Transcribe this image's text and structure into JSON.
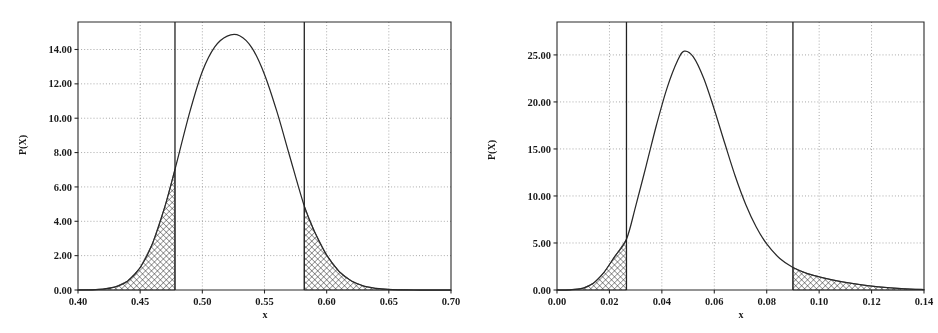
{
  "figure": {
    "panel_count": 2
  },
  "chart_data": [
    {
      "id": "left-plot",
      "type": "line",
      "title": "",
      "subtitle": "",
      "xlabel": "x",
      "ylabel": "P(X)",
      "xlim": [
        0.4,
        0.7
      ],
      "ylim": [
        0.0,
        15.6
      ],
      "grid": true,
      "legend": "none",
      "xticks": [
        0.4,
        0.45,
        0.5,
        0.55,
        0.6,
        0.65,
        0.7
      ],
      "xticklabels": [
        "0.40",
        "0.45",
        "0.50",
        "0.55",
        "0.60",
        "0.65",
        "0.70"
      ],
      "yticks": [
        0.0,
        2.0,
        4.0,
        6.0,
        8.0,
        10.0,
        12.0,
        14.0
      ],
      "yticklabels": [
        "0.00",
        "2.00",
        "4.00",
        "6.00",
        "8.00",
        "10.00",
        "12.00",
        "14.00"
      ],
      "distribution": {
        "kind": "normal-like-density",
        "peak_x": 0.53,
        "peak_y": 14.8,
        "sigma": 0.0272
      },
      "annotations": {
        "vertical_lines": [
          0.478,
          0.582
        ],
        "shaded_tails": [
          {
            "name": "lower-tail",
            "from": 0.4,
            "to": 0.478,
            "hatch": "cross-hatch"
          },
          {
            "name": "upper-tail",
            "from": 0.582,
            "to": 0.7,
            "hatch": "cross-hatch"
          }
        ]
      },
      "series": [
        {
          "name": "P(X)",
          "x": [
            0.4,
            0.41,
            0.42,
            0.43,
            0.44,
            0.45,
            0.46,
            0.47,
            0.478,
            0.49,
            0.5,
            0.51,
            0.52,
            0.53,
            0.54,
            0.55,
            0.56,
            0.57,
            0.582,
            0.59,
            0.6,
            0.61,
            0.62,
            0.63,
            0.64,
            0.65,
            0.66,
            0.67,
            0.68,
            0.69,
            0.7
          ],
          "y": [
            0.0,
            0.01,
            0.05,
            0.18,
            0.53,
            1.3,
            2.72,
            4.88,
            7.02,
            10.38,
            12.72,
            14.15,
            14.78,
            14.8,
            14.08,
            12.55,
            10.38,
            7.86,
            4.88,
            3.44,
            2.03,
            1.08,
            0.52,
            0.22,
            0.09,
            0.03,
            0.01,
            0.0,
            0.0,
            0.0,
            0.0
          ]
        }
      ]
    },
    {
      "id": "right-plot",
      "type": "line",
      "title": "",
      "subtitle": "",
      "xlabel": "x",
      "ylabel": "P(X)",
      "xlim": [
        0.0,
        0.14
      ],
      "ylim": [
        0.0,
        28.5
      ],
      "grid": true,
      "legend": "none",
      "xticks": [
        0.0,
        0.02,
        0.04,
        0.06,
        0.08,
        0.1,
        0.12,
        0.14
      ],
      "xticklabels": [
        "0.00",
        "0.02",
        "0.04",
        "0.06",
        "0.08",
        "0.10",
        "0.12",
        "0.14"
      ],
      "yticks": [
        0.0,
        5.0,
        10.0,
        15.0,
        20.0,
        25.0
      ],
      "yticklabels": [
        "0.00",
        "5.00",
        "10.00",
        "15.00",
        "20.00",
        "25.00"
      ],
      "distribution": {
        "kind": "right-skewed-density",
        "peak_x": 0.0485,
        "peak_y": 25.4,
        "sigma": 0.0185
      },
      "annotations": {
        "vertical_lines": [
          0.0265,
          0.09
        ],
        "shaded_tails": [
          {
            "name": "lower-tail",
            "from": 0.0,
            "to": 0.0265,
            "hatch": "cross-hatch"
          },
          {
            "name": "upper-tail",
            "from": 0.09,
            "to": 0.14,
            "hatch": "cross-hatch"
          }
        ]
      },
      "series": [
        {
          "name": "P(X)",
          "x": [
            0.0,
            0.005,
            0.01,
            0.014,
            0.018,
            0.022,
            0.0265,
            0.03,
            0.034,
            0.038,
            0.042,
            0.046,
            0.0485,
            0.052,
            0.056,
            0.06,
            0.064,
            0.068,
            0.072,
            0.076,
            0.08,
            0.085,
            0.09,
            0.095,
            0.1,
            0.105,
            0.11,
            0.115,
            0.12,
            0.125,
            0.13,
            0.135,
            0.14
          ],
          "y": [
            0.0,
            0.02,
            0.2,
            0.75,
            1.9,
            3.55,
            5.4,
            8.9,
            13.2,
            17.6,
            21.5,
            24.4,
            25.4,
            24.8,
            22.5,
            19.2,
            15.6,
            12.1,
            9.1,
            6.7,
            4.9,
            3.35,
            2.4,
            1.8,
            1.4,
            1.08,
            0.82,
            0.6,
            0.42,
            0.28,
            0.18,
            0.1,
            0.05
          ]
        }
      ]
    }
  ],
  "colors": {
    "curve": "#2b2b2b",
    "frame": "#2a2a2a",
    "grid": "#8d8d8d",
    "vline": "#232323",
    "hatch": "#3a3a3a",
    "background": "#ffffff"
  }
}
